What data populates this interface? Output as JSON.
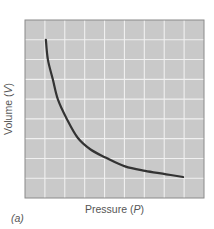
{
  "chart_data": {
    "type": "line",
    "title": "",
    "xlabel": "Pressure (P)",
    "ylabel": "Volume (V)",
    "xlabel_parts": [
      "Pressure (",
      "P",
      ")"
    ],
    "ylabel_parts": [
      "Volume (",
      "V",
      ")"
    ],
    "panel_label": "(a)",
    "x_ticks": [],
    "y_ticks": [],
    "xlim": [
      0,
      9
    ],
    "ylim": [
      0,
      9
    ],
    "grid": true,
    "grid_divisions": {
      "x": 9,
      "y": 9
    },
    "legend": null,
    "series": [
      {
        "name": "V vs P (inverse relationship)",
        "x": [
          1.05,
          1.15,
          1.4,
          1.65,
          2.1,
          2.65,
          3.3,
          4.05,
          5.03,
          6.04,
          7.1,
          7.95
        ],
        "y": [
          8.0,
          7.0,
          6.0,
          5.0,
          4.0,
          3.05,
          2.45,
          2.05,
          1.6,
          1.37,
          1.2,
          1.06
        ]
      }
    ]
  },
  "colors": {
    "plot_background": "#c9c9c9",
    "grid_line": "#f0f0f0",
    "frame": "#8a8a8a",
    "curve": "#333333",
    "text": "#555555"
  }
}
